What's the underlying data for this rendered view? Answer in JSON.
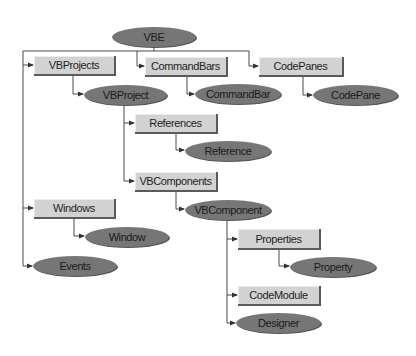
{
  "diagram": {
    "legend": {
      "collection_style": "light gray rectangle",
      "object_style": "dark gray ellipse"
    },
    "colors": {
      "collection_fill": "#d2d2d2",
      "object_fill": "#767676",
      "line": "#4a4a4a",
      "background": "#ffffff"
    },
    "nodes": {
      "vbe": {
        "label": "VBE",
        "type": "object"
      },
      "vbprojects": {
        "label": "VBProjects",
        "type": "collection"
      },
      "commandbars": {
        "label": "CommandBars",
        "type": "collection"
      },
      "codepanes": {
        "label": "CodePanes",
        "type": "collection"
      },
      "vbproject": {
        "label": "VBProject",
        "type": "object"
      },
      "commandbar": {
        "label": "CommandBar",
        "type": "object"
      },
      "codepane": {
        "label": "CodePane",
        "type": "object"
      },
      "references": {
        "label": "References",
        "type": "collection"
      },
      "reference": {
        "label": "Reference",
        "type": "object"
      },
      "vbcomponents": {
        "label": "VBComponents",
        "type": "collection"
      },
      "vbcomponent": {
        "label": "VBComponent",
        "type": "object"
      },
      "windows": {
        "label": "Windows",
        "type": "collection"
      },
      "window": {
        "label": "Window",
        "type": "object"
      },
      "events": {
        "label": "Events",
        "type": "object"
      },
      "properties": {
        "label": "Properties",
        "type": "collection"
      },
      "property": {
        "label": "Property",
        "type": "object"
      },
      "codemodule": {
        "label": "CodeModule",
        "type": "collection"
      },
      "designer": {
        "label": "Designer",
        "type": "object"
      }
    },
    "edges": [
      [
        "VBE",
        "VBProjects"
      ],
      [
        "VBE",
        "CommandBars"
      ],
      [
        "VBE",
        "CodePanes"
      ],
      [
        "VBE",
        "Windows"
      ],
      [
        "VBE",
        "Events"
      ],
      [
        "VBProjects",
        "VBProject"
      ],
      [
        "CommandBars",
        "CommandBar"
      ],
      [
        "CodePanes",
        "CodePane"
      ],
      [
        "VBProject",
        "References"
      ],
      [
        "VBProject",
        "VBComponents"
      ],
      [
        "References",
        "Reference"
      ],
      [
        "VBComponents",
        "VBComponent"
      ],
      [
        "Windows",
        "Window"
      ],
      [
        "VBComponent",
        "Properties"
      ],
      [
        "VBComponent",
        "CodeModule"
      ],
      [
        "VBComponent",
        "Designer"
      ],
      [
        "Properties",
        "Property"
      ]
    ]
  }
}
